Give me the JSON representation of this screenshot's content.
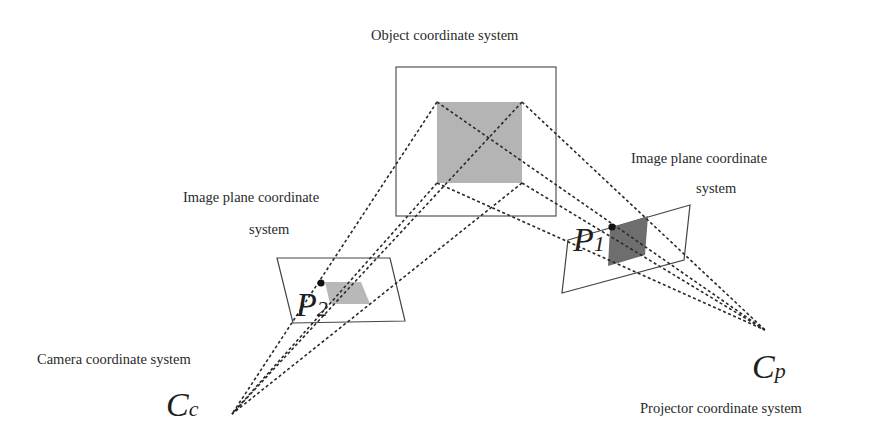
{
  "diagram": {
    "title": "Object coordinate system",
    "labels": {
      "object": "Object coordinate system",
      "left_image_plane_line1": "Image plane coordinate",
      "left_image_plane_line2": "system",
      "right_image_plane_line1": "Image plane coordinate",
      "right_image_plane_line2": "system",
      "camera": "Camera coordinate system",
      "projector": "Projector coordinate system"
    },
    "symbols": {
      "p2_main": "P",
      "p2_sub": "2",
      "p1_main": "P",
      "p1_sub": "1",
      "cc_main": "C",
      "cc_sub": "c",
      "cp_main": "C",
      "cp_sub": "p"
    },
    "colors": {
      "object_square": "#b4b4b4",
      "left_square": "#b8b8b8",
      "right_square": "#6e6e6e",
      "lines": "#2a2a2a"
    }
  }
}
